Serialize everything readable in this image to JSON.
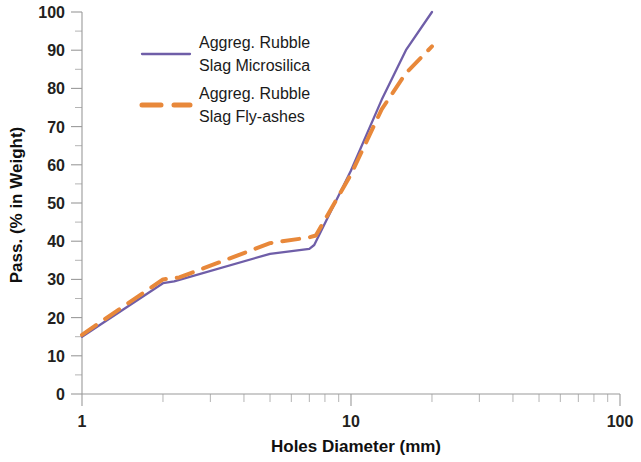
{
  "chart_data": {
    "type": "line",
    "title": "",
    "xlabel": "Holes Diameter (mm)",
    "ylabel": "Pass. (% in Weight)",
    "xscale": "log",
    "yscale": "linear",
    "xlim": [
      1,
      100
    ],
    "ylim": [
      0,
      100
    ],
    "xticks": [
      1,
      10,
      100
    ],
    "xtick_labels": [
      "1",
      "10",
      "100"
    ],
    "yticks": [
      0,
      10,
      20,
      30,
      40,
      50,
      60,
      70,
      80,
      90,
      100
    ],
    "ytick_labels": [
      "0",
      "10",
      "20",
      "30",
      "40",
      "50",
      "60",
      "70",
      "80",
      "90",
      "100"
    ],
    "yminor_step": 5,
    "grid": false,
    "legend_position": "upper-left-inside",
    "series": [
      {
        "name": "Aggreg. Rubble Slag Microsilica",
        "color": "#6f5ea8",
        "style": "solid",
        "width": 2.3,
        "points": [
          [
            1.0,
            15.0
          ],
          [
            2.0,
            29.0
          ],
          [
            2.2,
            29.5
          ],
          [
            5.0,
            36.7
          ],
          [
            7.0,
            38.0
          ],
          [
            7.3,
            39.0
          ],
          [
            10.0,
            58.5
          ],
          [
            13.0,
            77.0
          ],
          [
            16.0,
            90.0
          ],
          [
            20.0,
            100.0
          ]
        ]
      },
      {
        "name": "Aggreg. Rubble Slag Fly-ashes",
        "color": "#e8883a",
        "style": "dashed",
        "width": 4.0,
        "points": [
          [
            1.0,
            15.5
          ],
          [
            2.0,
            30.0
          ],
          [
            2.3,
            30.5
          ],
          [
            5.0,
            39.5
          ],
          [
            7.0,
            41.0
          ],
          [
            7.4,
            41.5
          ],
          [
            10.0,
            57.5
          ],
          [
            13.0,
            74.5
          ],
          [
            16.0,
            84.0
          ],
          [
            20.0,
            91.0
          ]
        ]
      }
    ]
  },
  "legend": {
    "entries": [
      {
        "label_line1": "Aggreg. Rubble",
        "label_line2": "Slag Microsilica",
        "color": "#6f5ea8",
        "style": "solid"
      },
      {
        "label_line1": "Aggreg. Rubble",
        "label_line2": "Slag Fly-ashes",
        "color": "#e8883a",
        "style": "dashed"
      }
    ]
  }
}
